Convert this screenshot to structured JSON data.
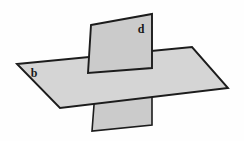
{
  "figure": {
    "background_color": "#fefefe",
    "width": 244,
    "height": 141
  },
  "labels": {
    "horizontal_plane": "b",
    "vertical_plane": "d"
  },
  "colors": {
    "horizontal_plane_fill": "#d5d5d5",
    "vertical_plane_fill": "#cbcbcb",
    "outline": "#1c1c1c",
    "background": "#fefefe"
  },
  "geometry": {
    "horizontal_plane": {
      "name": "plane-b",
      "shape": "parallelogram",
      "points": "17,64 192,47 228,88 60,108"
    },
    "vertical_plane_upper": {
      "name": "plane-d-upper",
      "shape": "quadrilateral",
      "points": "91,25 152,14 152,68 88,73"
    },
    "vertical_plane_lower": {
      "name": "plane-d-lower",
      "shape": "quadrilateral",
      "points": "95,92 152,84 152,125 92,131"
    },
    "intersection_line": {
      "name": "intersection-segment",
      "points": "88,73 152,68"
    }
  },
  "label_positions": {
    "b": {
      "x": 34,
      "y": 77
    },
    "d": {
      "x": 137,
      "y": 33
    }
  }
}
